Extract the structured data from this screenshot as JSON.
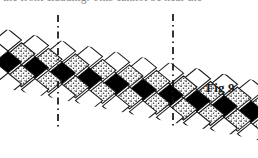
{
  "page": {
    "width": 258,
    "height": 158,
    "background": "#ffffff",
    "header_running_text": "the front cladding. This cannot be near the"
  },
  "figure": {
    "label": "Fig 9",
    "caption_color": "#1a1a1a",
    "colors": {
      "outline": "#1a1a1a",
      "tile_white": "#ffffff",
      "tile_black": "#000000",
      "tile_stipple_base": "#ffffff",
      "tile_stipple_dot": "#3a3a3a",
      "dash_line": "#111111"
    },
    "geometry": {
      "tile_half_width": 13.5,
      "tile_half_height": 11.0,
      "band_slope_dy_per_dx": 0.205,
      "origin_x": 8,
      "origin_y": 40,
      "columns": 17,
      "rows": 5
    },
    "rows": [
      {
        "index": 0,
        "name": "top-course",
        "fill": "white",
        "count": 16
      },
      {
        "index": 1,
        "name": "upper-stipple",
        "fill": "stipple",
        "count": 16
      },
      {
        "index": 2,
        "name": "centre-course",
        "fill": "black",
        "count": 16
      },
      {
        "index": 3,
        "name": "lower-stipple",
        "fill": "stipple",
        "count": 16
      },
      {
        "index": 4,
        "name": "bottom-course",
        "fill": "white",
        "count": 16
      }
    ],
    "section_lines": [
      {
        "name": "section-line-left",
        "x": 58,
        "y_top": 15,
        "y_bottom": 127
      },
      {
        "name": "section-line-right",
        "x": 173,
        "y_top": 14,
        "y_bottom": 126
      }
    ]
  }
}
